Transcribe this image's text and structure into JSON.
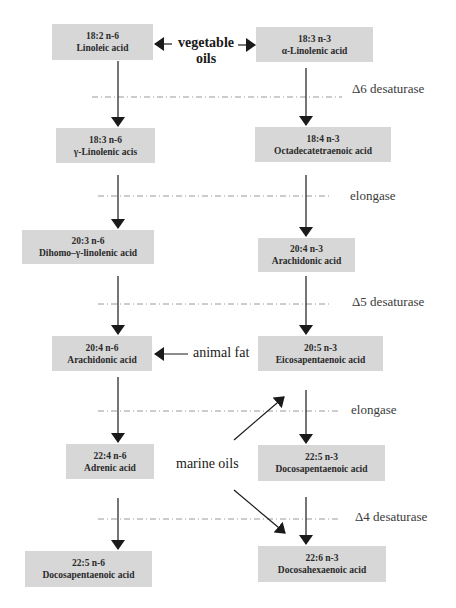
{
  "diagram": {
    "title": "",
    "n6_pathway": [
      {
        "formula": "18:2 n-6",
        "name": "Linoleic acid"
      },
      {
        "formula": "18:3 n-6",
        "name": "γ-Linolenic acis"
      },
      {
        "formula": "20:3 n-6",
        "name": "Dihomo–γ-linolenic acid"
      },
      {
        "formula": "20:4 n-6",
        "name": "Arachidonic acid"
      },
      {
        "formula": "22:4 n-6",
        "name": "Adrenic acid"
      },
      {
        "formula": "22:5 n-6",
        "name": "Docosapentaenoic acid"
      }
    ],
    "n3_pathway": [
      {
        "formula": "18:3 n-3",
        "name": "α-Linolenic acid"
      },
      {
        "formula": "18:4 n-3",
        "name": "Octadecatetraenoic acid"
      },
      {
        "formula": "20:4 n-3",
        "name": "Arachidonic acid"
      },
      {
        "formula": "20:5 n-3",
        "name": "Eicosapentaenoic acid"
      },
      {
        "formula": "22:5 n-3",
        "name": "Docosapentaenoic acid"
      },
      {
        "formula": "22:6 n-3",
        "name": "Docosahexaenoic acid"
      }
    ],
    "enzyme_steps": [
      "Δ6 desaturase",
      "elongase",
      "Δ5 desaturase",
      "elongase",
      "Δ4 desaturase"
    ],
    "sources": {
      "vegetable_oils_line1": "vegetable",
      "vegetable_oils_line2": "oils",
      "animal_fat": "animal fat",
      "marine_oils": "marine oils"
    },
    "colors": {
      "box_fill": "#d7d7d7",
      "arrow": "#1a1a1a",
      "step_line": "#9a9a9a",
      "text": "#2a2a2a"
    }
  }
}
